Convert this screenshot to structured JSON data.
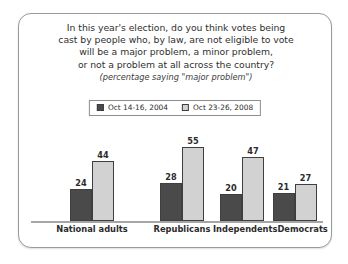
{
  "frame": {
    "border_color": "#9a9a9a",
    "background": "#ffffff"
  },
  "chart_data": {
    "type": "bar",
    "title_lines": [
      "In this year's election, do you think votes being",
      "cast by people who, by law, are not eligible to vote",
      "will be a major problem, a minor problem,",
      "or not a problem at all across the country?"
    ],
    "subtitle": "(percentage saying \"major problem\")",
    "categories": [
      "National adults",
      "Republicans",
      "Independents",
      "Democrats"
    ],
    "series": [
      {
        "name": "Oct 14-16, 2004",
        "color": "#4a4a4a",
        "values": [
          24,
          28,
          20,
          21
        ]
      },
      {
        "name": "Oct 23-26, 2008",
        "color": "#d2d2d2",
        "values": [
          44,
          55,
          47,
          27
        ]
      }
    ],
    "xlabel": "",
    "ylabel": "",
    "ylim": [
      0,
      62
    ],
    "grid": false,
    "legend_position": "top-center",
    "value_labels": true
  },
  "legend": {
    "items": [
      {
        "label": "Oct 14-16, 2004",
        "swatch": "dark"
      },
      {
        "label": "Oct 23-26, 2008",
        "swatch": "light"
      }
    ]
  }
}
